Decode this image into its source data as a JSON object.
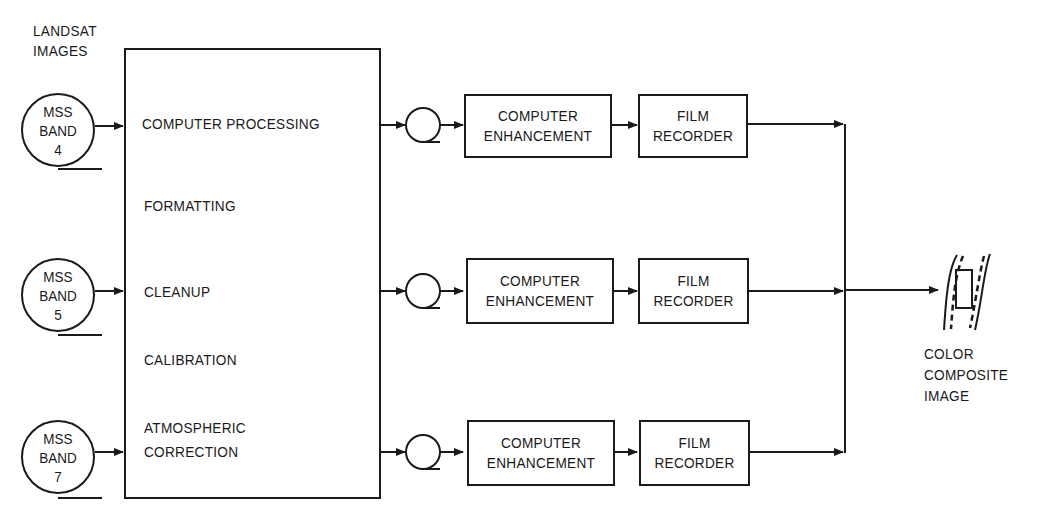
{
  "source_label": {
    "line1": "LANDSAT",
    "line2": "IMAGES"
  },
  "bands": [
    {
      "line1": "MSS",
      "line2": "BAND",
      "line3": "4"
    },
    {
      "line1": "MSS",
      "line2": "BAND",
      "line3": "5"
    },
    {
      "line1": "MSS",
      "line2": "BAND",
      "line3": "7"
    }
  ],
  "processing_box": {
    "steps": [
      "COMPUTER PROCESSING",
      "FORMATTING",
      "CLEANUP",
      "CALIBRATION",
      "ATMOSPHERIC",
      "CORRECTION"
    ]
  },
  "channels": [
    {
      "enhancement": {
        "line1": "COMPUTER",
        "line2": "ENHANCEMENT"
      },
      "recorder": {
        "line1": "FILM",
        "line2": "RECORDER"
      }
    },
    {
      "enhancement": {
        "line1": "COMPUTER",
        "line2": "ENHANCEMENT"
      },
      "recorder": {
        "line1": "FILM",
        "line2": "RECORDER"
      }
    },
    {
      "enhancement": {
        "line1": "COMPUTER",
        "line2": "ENHANCEMENT"
      },
      "recorder": {
        "line1": "FILM",
        "line2": "RECORDER"
      }
    }
  ],
  "output_label": {
    "line1": "COLOR",
    "line2": "COMPOSITE",
    "line3": "IMAGE"
  },
  "colors": {
    "ink": "#1a1a1a",
    "background": "#ffffff"
  }
}
